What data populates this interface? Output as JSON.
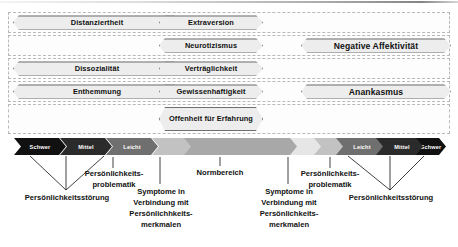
{
  "diagram": {
    "colors": {
      "hex_fill": "#ededed",
      "hex_border": "#6f6f6f",
      "row_border": "#b9b9b9",
      "severe": "#111111",
      "moderate": "#2e2e2e",
      "mild": "#767676",
      "subclinical": "#c9c9c9",
      "normal": "#a8a8a8",
      "near_normal": "#e4e4e4"
    }
  },
  "matrix": {
    "rows": [
      {
        "id": "row-1",
        "cells": [
          {
            "label": "Distanziertheit",
            "column": "a",
            "width": 168
          },
          {
            "label": "Extraversion",
            "column": "b",
            "width": 104
          },
          {
            "label": "",
            "column": "c",
            "width": 0
          }
        ]
      },
      {
        "id": "row-2",
        "cells": [
          {
            "label": "",
            "column": "a",
            "width": 0
          },
          {
            "label": "Neurotizismus",
            "column": "b",
            "width": 104
          },
          {
            "label": "Negative Affektivität",
            "column": "c",
            "width": 150
          }
        ]
      },
      {
        "id": "row-3",
        "cells": [
          {
            "label": "Dissozialität",
            "column": "a",
            "width": 168
          },
          {
            "label": "Verträglichkeit",
            "column": "b",
            "width": 104
          },
          {
            "label": "",
            "column": "c",
            "width": 0
          }
        ]
      },
      {
        "id": "row-4",
        "cells": [
          {
            "label": "Enthemmung",
            "column": "a",
            "width": 168
          },
          {
            "label": "Gewissenhaftigkeit",
            "column": "b",
            "width": 104
          },
          {
            "label": "Anankasmus",
            "column": "c",
            "width": 150
          }
        ]
      },
      {
        "id": "row-5",
        "cells": [
          {
            "label": "",
            "column": "a",
            "width": 0
          },
          {
            "label": "Offenheit für Erfahrung",
            "column": "b",
            "width": 104
          },
          {
            "label": "",
            "column": "c",
            "width": 0
          }
        ]
      }
    ]
  },
  "severity_bar": {
    "segments": [
      {
        "label": "Schwer",
        "x": 0,
        "width": 52,
        "color": "#111111",
        "text": "light"
      },
      {
        "label": "Mittel",
        "x": 46,
        "width": 52,
        "color": "#2b2b2b",
        "text": "light"
      },
      {
        "label": "Leicht",
        "x": 92,
        "width": 52,
        "color": "#6f6f6f",
        "text": "light"
      },
      {
        "label": "",
        "x": 138,
        "width": 52,
        "color": "#c2c2c2",
        "text": "dark"
      },
      {
        "label": "",
        "x": 184,
        "width": 52,
        "color": "#e6e6e6",
        "text": "dark"
      },
      {
        "label": "",
        "x": 230,
        "width": 52,
        "color": "#e6e6e6",
        "text": "dark"
      },
      {
        "label": "",
        "x": 276,
        "width": 52,
        "color": "#c2c2c2",
        "text": "dark"
      },
      {
        "label": "Leicht",
        "x": 322,
        "width": 52,
        "color": "#6f6f6f",
        "text": "light"
      },
      {
        "label": "Mittel",
        "x": 368,
        "width": 52,
        "color": "#2b2b2b",
        "text": "light"
      },
      {
        "label": "Schwer",
        "x": 414,
        "width": 18,
        "color": "#111111",
        "text": "light"
      }
    ],
    "normal_band": {
      "label": "",
      "x": 148,
      "width": 130,
      "color": "#a8a8a8"
    }
  },
  "captions": {
    "left_disorder": "Persönlichkeitsstörung",
    "left_problem": "Persönlichkeits-\nproblematik",
    "left_symptoms": "Symptome in\nVerbindung mit\nPersönlichhkeits-\nmerkmalen",
    "normal_range": "Normbereich",
    "right_symptoms": "Symptome in\nVerbindung mit\nPersönlichkeits-\nmerkmalen",
    "right_problem": "Persönlichkeits-\nproblematik",
    "right_disorder": "Persönlichkeitsstörung"
  }
}
